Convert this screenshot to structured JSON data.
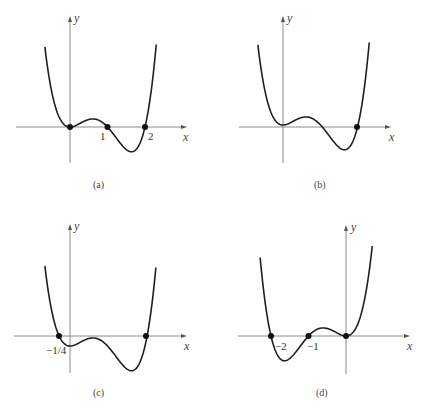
{
  "chart_data": [
    {
      "type": "line",
      "panel": "(a)",
      "caption": "(a)",
      "xlabel": "x",
      "ylabel": "y",
      "function_shape": "x^2 (x-1)(x-2)",
      "marked_points": [
        {
          "x": 0,
          "y": 0,
          "label": ""
        },
        {
          "x": 1,
          "y": 0,
          "label": "1"
        },
        {
          "x": 2,
          "y": 0,
          "label": "2"
        }
      ],
      "xlim": [
        -1.45,
        3.1
      ],
      "ylim": [
        -0.9,
        2.75
      ],
      "grid": false
    },
    {
      "type": "line",
      "panel": "(b)",
      "caption": "(b)",
      "xlabel": "x",
      "ylabel": "y",
      "function_shape": "x^2 (x-1)(x-2) + 0.05",
      "marked_points": [
        {
          "x": 1.98,
          "y": 0,
          "label": ""
        }
      ],
      "xlim": [
        -1.2,
        2.85
      ],
      "ylim": [
        -0.9,
        2.75
      ],
      "grid": false
    },
    {
      "type": "line",
      "panel": "(c)",
      "caption": "(c)",
      "xlabel": "x",
      "ylabel": "y",
      "function_shape": "x^2 (x-1)(x-2) - 1/4",
      "y_intercept_label": "−1/4",
      "marked_points": [
        {
          "x": -0.29,
          "y": 0,
          "label": ""
        },
        {
          "x": 2.05,
          "y": 0,
          "label": ""
        }
      ],
      "xlim": [
        -1.5,
        3.1
      ],
      "ylim": [
        -0.95,
        2.8
      ],
      "grid": false
    },
    {
      "type": "line",
      "panel": "(d)",
      "caption": "(d)",
      "xlabel": "x",
      "ylabel": "y",
      "function_shape": "x^2 (x+1)(x+2)",
      "marked_points": [
        {
          "x": -2,
          "y": 0,
          "label": "−2"
        },
        {
          "x": -1,
          "y": 0,
          "label": "−1"
        },
        {
          "x": 0,
          "y": 0,
          "label": ""
        }
      ],
      "xlim": [
        -2.9,
        1.7
      ],
      "ylim": [
        -0.95,
        2.8
      ],
      "grid": false
    }
  ],
  "panels": {
    "a": {
      "caption": "(a)",
      "x_axis": "x",
      "y_axis": "y",
      "tick1": "1",
      "tick2": "2"
    },
    "b": {
      "caption": "(b)",
      "x_axis": "x",
      "y_axis": "y"
    },
    "c": {
      "caption": "(c)",
      "x_axis": "x",
      "y_axis": "y",
      "intercept": "−1/4"
    },
    "d": {
      "caption": "(d)",
      "x_axis": "x",
      "y_axis": "y",
      "tick_m2": "−2",
      "tick_m1": "−1"
    }
  }
}
